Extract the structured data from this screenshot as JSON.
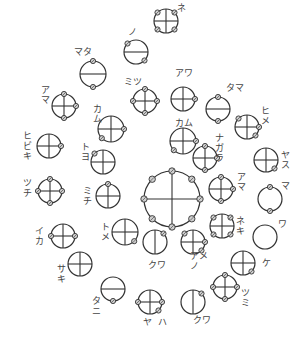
{
  "diagram": {
    "stroke_color": "#333333",
    "node_fill": "#cfcfcf",
    "circles": [
      {
        "id": "ne-top",
        "cx": 166,
        "cy": 21,
        "r": 12,
        "lines": "cross",
        "nodes": [
          "ul",
          "ur",
          "ll",
          "lr"
        ],
        "label": "ネ",
        "lx": 177,
        "ly": 3,
        "vertical": false
      },
      {
        "id": "no",
        "cx": 136,
        "cy": 52,
        "r": 12,
        "lines": "h",
        "nodes": [
          "ul",
          "lr"
        ],
        "label": "ノ",
        "lx": 128,
        "ly": 27,
        "vertical": false
      },
      {
        "id": "mata",
        "cx": 93,
        "cy": 74,
        "r": 13,
        "lines": "h",
        "nodes": [
          "t",
          "b"
        ],
        "label": "マタ",
        "lx": 74,
        "ly": 47,
        "vertical": false
      },
      {
        "id": "amaL",
        "cx": 64,
        "cy": 106,
        "r": 12,
        "lines": "cross",
        "nodes": [
          "t",
          "r",
          "b"
        ],
        "label": "ア\nマ",
        "lx": 41,
        "ly": 85,
        "vertical": true
      },
      {
        "id": "mitsu",
        "cx": 145,
        "cy": 101,
        "r": 12,
        "lines": "cross",
        "nodes": [
          "t",
          "r",
          "b",
          "l"
        ],
        "label": "ミツ",
        "lx": 124,
        "ly": 77,
        "vertical": false
      },
      {
        "id": "awa",
        "cx": 183,
        "cy": 99,
        "r": 12,
        "lines": "cross",
        "nodes": [
          "r"
        ],
        "label": "アワ",
        "lx": 175,
        "ly": 68,
        "vertical": false
      },
      {
        "id": "tama",
        "cx": 218,
        "cy": 109,
        "r": 12,
        "lines": "h",
        "nodes": [
          "t",
          "b"
        ],
        "label": "タマ",
        "lx": 226,
        "ly": 83,
        "vertical": false
      },
      {
        "id": "kamuL",
        "cx": 111,
        "cy": 129,
        "r": 13,
        "lines": "cross",
        "nodes": [
          "r",
          "ll"
        ],
        "label": "カ\nム",
        "lx": 93,
        "ly": 104,
        "vertical": true
      },
      {
        "id": "hime",
        "cx": 247,
        "cy": 127,
        "r": 12,
        "lines": "cross",
        "nodes": [
          "ul",
          "r",
          "lr"
        ],
        "label": "ヒ\nメ",
        "lx": 261,
        "ly": 106,
        "vertical": true
      },
      {
        "id": "kamuC",
        "cx": 183,
        "cy": 141,
        "r": 13,
        "lines": "cross",
        "nodes": [
          "r",
          "ll"
        ],
        "label": "カム",
        "lx": 175,
        "ly": 118,
        "vertical": false
      },
      {
        "id": "nagara",
        "cx": 205,
        "cy": 158,
        "r": 12,
        "lines": "cross",
        "nodes": [
          "t",
          "r",
          "b"
        ],
        "label": "ナ\nガ\nラ",
        "lx": 215,
        "ly": 133,
        "vertical": true
      },
      {
        "id": "hibiki",
        "cx": 49,
        "cy": 146,
        "r": 12,
        "lines": "cross",
        "nodes": [
          "r"
        ],
        "label": "ヒ\nビ\nキ",
        "lx": 23,
        "ly": 131,
        "vertical": true
      },
      {
        "id": "toyo",
        "cx": 103,
        "cy": 162,
        "r": 12,
        "lines": "cross",
        "nodes": [
          "ul"
        ],
        "label": "ト\nヨ",
        "lx": 81,
        "ly": 142,
        "vertical": true
      },
      {
        "id": "yasuma",
        "cx": 266,
        "cy": 160,
        "r": 12,
        "lines": "cross",
        "nodes": [
          "lr"
        ],
        "label": "ヤ\nス",
        "lx": 281,
        "ly": 150,
        "vertical": true
      },
      {
        "id": "tsuchi",
        "cx": 50,
        "cy": 191,
        "r": 12,
        "lines": "cross",
        "nodes": [
          "t",
          "r",
          "b",
          "l"
        ],
        "label": "ツ\nチ",
        "lx": 23,
        "ly": 178,
        "vertical": true
      },
      {
        "id": "michi",
        "cx": 108,
        "cy": 196,
        "r": 12,
        "lines": "cross",
        "nodes": [
          "t"
        ],
        "label": "ミ\nチ",
        "lx": 83,
        "ly": 186,
        "vertical": true
      },
      {
        "id": "amaR",
        "cx": 221,
        "cy": 189,
        "r": 12,
        "lines": "cross",
        "nodes": [
          "t",
          "r",
          "b"
        ],
        "label": "ア\nマ",
        "lx": 237,
        "ly": 172,
        "vertical": true
      },
      {
        "id": "maR",
        "cx": 270,
        "cy": 199,
        "r": 12,
        "lines": "none",
        "nodes": [
          "t",
          "b"
        ],
        "label": "マ",
        "lx": 281,
        "ly": 181,
        "vertical": false
      },
      {
        "id": "ika",
        "cx": 63,
        "cy": 236,
        "r": 12,
        "lines": "cross",
        "nodes": [
          "l",
          "r"
        ],
        "label": "イ\nカ",
        "lx": 35,
        "ly": 226,
        "vertical": true
      },
      {
        "id": "tome",
        "cx": 125,
        "cy": 232,
        "r": 13,
        "lines": "cross",
        "nodes": [
          "lr"
        ],
        "label": "ト\nメ",
        "lx": 101,
        "ly": 222,
        "vertical": true
      },
      {
        "id": "neki",
        "cx": 222,
        "cy": 226,
        "r": 12,
        "lines": "cross",
        "nodes": [
          "ul",
          "ur",
          "ll",
          "lr"
        ],
        "label": "ネ\nキ",
        "lx": 236,
        "ly": 216,
        "vertical": true
      },
      {
        "id": "wa",
        "cx": 265,
        "cy": 237,
        "r": 12,
        "lines": "none",
        "nodes": [],
        "label": "ワ",
        "lx": 278,
        "ly": 219,
        "vertical": false
      },
      {
        "id": "kuwaL",
        "cx": 155,
        "cy": 242,
        "r": 12,
        "lines": "v",
        "nodes": [
          "ur"
        ],
        "label": "クワ",
        "lx": 148,
        "ly": 260,
        "vertical": false
      },
      {
        "id": "nomea",
        "cx": 193,
        "cy": 242,
        "r": 12,
        "lines": "cross",
        "nodes": [
          "ul",
          "r",
          "lr"
        ],
        "label": "アメ\nノ",
        "lx": 190,
        "ly": 251,
        "vertical": false
      },
      {
        "id": "ke",
        "cx": 243,
        "cy": 263,
        "r": 12,
        "lines": "cross",
        "nodes": [
          "lr"
        ],
        "label": "ケ",
        "lx": 262,
        "ly": 258,
        "vertical": false
      },
      {
        "id": "saki",
        "cx": 80,
        "cy": 264,
        "r": 12,
        "lines": "cross",
        "nodes": [],
        "label": "サ\nキ",
        "lx": 57,
        "ly": 264,
        "vertical": true
      },
      {
        "id": "tani",
        "cx": 113,
        "cy": 289,
        "r": 12,
        "lines": "h",
        "nodes": [
          "b"
        ],
        "label": "タ\nニ",
        "lx": 92,
        "ly": 296,
        "vertical": true
      },
      {
        "id": "tsumi",
        "cx": 225,
        "cy": 287,
        "r": 12,
        "lines": "cross",
        "nodes": [
          "t",
          "r",
          "b",
          "l"
        ],
        "label": "ツ\nミ",
        "lx": 241,
        "ly": 288,
        "vertical": true
      },
      {
        "id": "yaha",
        "cx": 150,
        "cy": 302,
        "r": 12,
        "lines": "cross",
        "nodes": [
          "l",
          "r",
          "lr"
        ],
        "label": "ヤ  ハ",
        "lx": 143,
        "ly": 317,
        "vertical": false
      },
      {
        "id": "kuwaB",
        "cx": 193,
        "cy": 302,
        "r": 12,
        "lines": "v",
        "nodes": [
          "ur"
        ],
        "label": "クワ",
        "lx": 193,
        "ly": 315,
        "vertical": false
      }
    ],
    "center": {
      "cx": 172,
      "cy": 199,
      "r": 28,
      "lines": "cross",
      "nodes": [
        "t",
        "ur",
        "r",
        "lr",
        "b",
        "ll",
        "l",
        "ul",
        "rx"
      ]
    }
  }
}
